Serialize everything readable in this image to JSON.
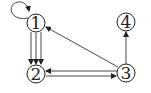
{
  "diagram": {
    "type": "directed-multigraph",
    "nodes": [
      {
        "id": "1",
        "label": "1",
        "x": 36,
        "y": 23
      },
      {
        "id": "2",
        "label": "2",
        "x": 36,
        "y": 74
      },
      {
        "id": "3",
        "label": "3",
        "x": 126,
        "y": 73
      },
      {
        "id": "4",
        "label": "4",
        "x": 126,
        "y": 22
      }
    ],
    "edges": [
      {
        "from": "1",
        "to": "1",
        "kind": "self-loop"
      },
      {
        "from": "1",
        "to": "2",
        "kind": "parallel",
        "count": 3
      },
      {
        "from": "2",
        "to": "3"
      },
      {
        "from": "3",
        "to": "2"
      },
      {
        "from": "3",
        "to": "1"
      },
      {
        "from": "3",
        "to": "4"
      }
    ],
    "colors": {
      "stroke": "#222222",
      "background": "#ffffff"
    }
  }
}
